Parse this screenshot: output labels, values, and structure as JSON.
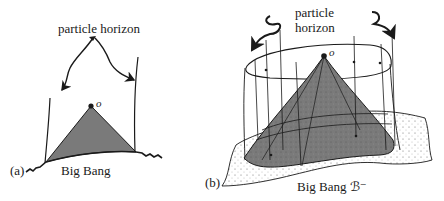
{
  "panel_a": {
    "tag": "(a)",
    "horizon_label": "particle horizon",
    "observer_label": "o",
    "bigbang_label": "Big Bang"
  },
  "panel_b": {
    "tag": "(b)",
    "horizon_label_line1": "particle",
    "horizon_label_line2": "horizon",
    "observer_label": "o",
    "bigbang_label": "Big Bang ℬ⁻"
  },
  "colors": {
    "ink": "#1a1a1a",
    "cone_fill": "#7a7a7a",
    "paper": "#ffffff"
  }
}
